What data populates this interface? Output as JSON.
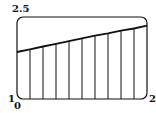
{
  "chart_data": {
    "type": "line",
    "title": "",
    "xlabel": "",
    "ylabel": "",
    "xlim": [
      0,
      2
    ],
    "ylim": [
      1,
      2.5
    ],
    "grid": false,
    "legend": null,
    "x": [
      0,
      0.2,
      0.4,
      0.6,
      0.8,
      1.0,
      1.2,
      1.4,
      1.6,
      1.8,
      2.0
    ],
    "series": [
      {
        "name": "f(x)",
        "values": [
          1.86,
          1.91,
          1.96,
          2.01,
          2.06,
          2.11,
          2.16,
          2.2,
          2.25,
          2.29,
          2.34
        ]
      }
    ],
    "vertical_lines_at": [
      0.2,
      0.4,
      0.6,
      0.8,
      1.0,
      1.2,
      1.4,
      1.6,
      1.8
    ],
    "tick_labels": {
      "y_top": "2.5",
      "y_bottom": "1",
      "x_left": "0",
      "x_right": "2"
    },
    "colors": {
      "line": "#111111",
      "frame": "#111111",
      "background": "#ffffff"
    }
  }
}
